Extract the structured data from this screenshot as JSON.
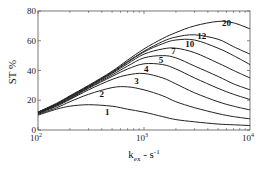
{
  "chart_data": {
    "type": "line",
    "title": "",
    "xlabel": "k_ex - s^-1",
    "ylabel": "ST %",
    "xscale": "log",
    "xlim": [
      100,
      10000
    ],
    "ylim": [
      0,
      80
    ],
    "x_ticks": [
      "10^2",
      "10^3",
      "10^4"
    ],
    "y_ticks": [
      "0",
      "20",
      "40",
      "60",
      "80"
    ],
    "grid": false,
    "legend": "inline curve labels",
    "x": [
      100,
      150,
      200,
      300,
      500,
      700,
      1000,
      1500,
      2000,
      3000,
      5000,
      7000,
      10000
    ],
    "series": [
      {
        "name": "1",
        "label_pos": [
          450,
          10
        ],
        "values": [
          10,
          14,
          16,
          17,
          16,
          14,
          12,
          9,
          7,
          5.5,
          4,
          3.5,
          3
        ]
      },
      {
        "name": "2",
        "label_pos": [
          400,
          22
        ],
        "values": [
          10.5,
          15,
          19,
          24,
          28.5,
          29,
          27,
          23,
          19,
          15,
          11,
          9,
          7.5
        ]
      },
      {
        "name": "3",
        "label_pos": [
          850,
          31
        ],
        "values": [
          11,
          16,
          20.5,
          27,
          34,
          37,
          38,
          35,
          31,
          25,
          19,
          16,
          13.5
        ]
      },
      {
        "name": "4",
        "label_pos": [
          1050,
          39
        ],
        "values": [
          11,
          16.5,
          21,
          28,
          36,
          41,
          44.5,
          44,
          41,
          35,
          28,
          24,
          20.5
        ]
      },
      {
        "name": "5",
        "label_pos": [
          1450,
          45
        ],
        "values": [
          11.5,
          17,
          21.5,
          28.5,
          37,
          43,
          48.5,
          50,
          48.5,
          43,
          36,
          31,
          27
        ]
      },
      {
        "name": "7",
        "label_pos": [
          1900,
          51
        ],
        "values": [
          11.5,
          17,
          22,
          29,
          38,
          44.5,
          51,
          54.5,
          55,
          52,
          45,
          40,
          35
        ]
      },
      {
        "name": "10",
        "label_pos": [
          2700,
          56
        ],
        "values": [
          12,
          17.5,
          22.5,
          29.5,
          38.5,
          45.5,
          52.5,
          58,
          60.5,
          60.5,
          55,
          50,
          44
        ]
      },
      {
        "name": "12",
        "label_pos": [
          3500,
          61
        ],
        "values": [
          12,
          17.5,
          22.5,
          29.5,
          39,
          46,
          53,
          59.5,
          62.5,
          64,
          61,
          56,
          51
        ]
      },
      {
        "name": "20",
        "label_pos": [
          6000,
          70
        ],
        "values": [
          12,
          18,
          23,
          30,
          39.5,
          47,
          54.5,
          61.5,
          65.5,
          70,
          73,
          72,
          68
        ]
      }
    ]
  }
}
